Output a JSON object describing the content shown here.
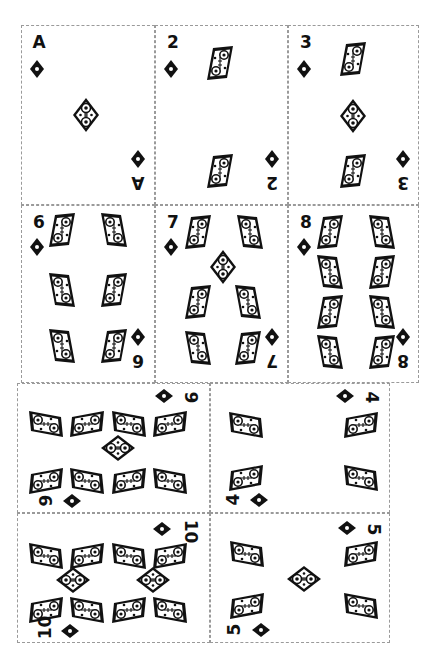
{
  "sheet": {
    "title": "Diamonds card sheet",
    "suit": "diamonds",
    "ink_color": "#111111",
    "border_color": "#9a9a9a",
    "background": "#ffffff"
  },
  "cards": [
    {
      "rank": "A",
      "label": "Ace of Diamonds",
      "orientation": "portrait",
      "pip_count": 1
    },
    {
      "rank": "2",
      "label": "Two of Diamonds",
      "orientation": "portrait",
      "pip_count": 2
    },
    {
      "rank": "3",
      "label": "Three of Diamonds",
      "orientation": "portrait",
      "pip_count": 3
    },
    {
      "rank": "6",
      "label": "Six of Diamonds",
      "orientation": "portrait",
      "pip_count": 6
    },
    {
      "rank": "7",
      "label": "Seven of Diamonds",
      "orientation": "portrait",
      "pip_count": 7
    },
    {
      "rank": "8",
      "label": "Eight of Diamonds",
      "orientation": "portrait",
      "pip_count": 8
    },
    {
      "rank": "9",
      "label": "Nine of Diamonds",
      "orientation": "landscape",
      "pip_count": 9
    },
    {
      "rank": "4",
      "label": "Four of Diamonds",
      "orientation": "landscape",
      "pip_count": 4
    },
    {
      "rank": "10",
      "label": "Ten of Diamonds",
      "orientation": "landscape",
      "pip_count": 10
    },
    {
      "rank": "5",
      "label": "Five of Diamonds",
      "orientation": "landscape",
      "pip_count": 5
    }
  ]
}
